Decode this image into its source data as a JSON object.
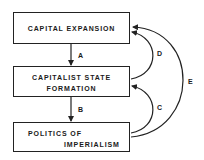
{
  "diagram": {
    "nodes": [
      {
        "id": "capital_expansion",
        "lines": [
          "CAPITAL EXPANSION"
        ]
      },
      {
        "id": "capitalist_state_formation",
        "lines": [
          "CAPITALIST STATE",
          "FORMATION"
        ]
      },
      {
        "id": "politics_of_imperialism",
        "lines": [
          "POLITICS OF",
          "IMPERIALISM"
        ]
      }
    ],
    "edges": [
      {
        "label": "A",
        "from": "capital_expansion",
        "to": "capitalist_state_formation"
      },
      {
        "label": "B",
        "from": "capitalist_state_formation",
        "to": "politics_of_imperialism"
      },
      {
        "label": "C",
        "from": "politics_of_imperialism",
        "to": "capitalist_state_formation"
      },
      {
        "label": "D",
        "from": "capitalist_state_formation",
        "to": "capital_expansion"
      },
      {
        "label": "E",
        "from": "politics_of_imperialism",
        "to": "capital_expansion"
      }
    ],
    "colors": {
      "line": "#222222",
      "background": "#ffffff"
    }
  }
}
